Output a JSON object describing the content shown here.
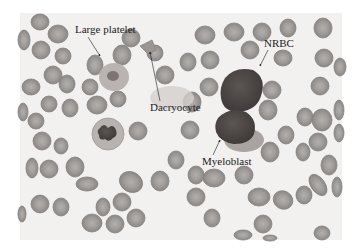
{
  "figure": {
    "type": "peripheral blood smear micrograph",
    "colors": {
      "background": "#ffffff",
      "smear_background": "#f2f1f0",
      "rbc_fill": "#9a9693",
      "rbc_edge": "#7f7b78",
      "rbc_center": "#b4b0ad",
      "nucleus_dark": "#4f4a48",
      "cytoplasm": "#a9a3a1",
      "label_text": "#1a1a1a"
    },
    "labels": [
      {
        "id": "large-platelet",
        "text": "Large platelet"
      },
      {
        "id": "dacryocyte",
        "text": "Dacryocyte"
      },
      {
        "id": "nrbc",
        "text": "NRBC"
      },
      {
        "id": "myeloblast",
        "text": "Myeloblast"
      }
    ]
  }
}
